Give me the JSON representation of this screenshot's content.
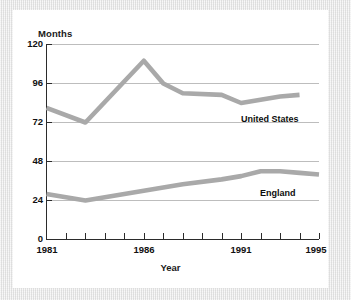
{
  "chart_data": {
    "type": "line",
    "title": "",
    "xlabel": "Year",
    "ylabel": "Months",
    "xlim": [
      1981,
      1995
    ],
    "ylim": [
      0,
      120
    ],
    "grid": true,
    "legend_position": "inline-right",
    "x": [
      1981,
      1982,
      1983,
      1984,
      1985,
      1986,
      1987,
      1988,
      1989,
      1990,
      1991,
      1992,
      1993,
      1994,
      1995
    ],
    "y_ticks": [
      0,
      24,
      48,
      72,
      96,
      120
    ],
    "y_tick_labels": [
      "0",
      "24",
      "48",
      "72",
      "96",
      "120"
    ],
    "x_ticks": [
      1981,
      1982,
      1983,
      1984,
      1985,
      1986,
      1987,
      1988,
      1989,
      1990,
      1991,
      1992,
      1993,
      1994,
      1995
    ],
    "x_tick_labels_shown": [
      "1981",
      "1986",
      "1991",
      "1995"
    ],
    "x_tick_labels_shown_values": [
      1981,
      1986,
      1991,
      1995
    ],
    "series": [
      {
        "name": "United States",
        "color": "#a9a9a9",
        "x": [
          1981,
          1983,
          1986,
          1987,
          1988,
          1990,
          1991,
          1992,
          1993,
          1994
        ],
        "values": [
          81,
          72,
          110,
          96,
          90,
          89,
          84,
          86,
          88,
          89
        ]
      },
      {
        "name": "England",
        "color": "#a9a9a9",
        "x": [
          1981,
          1983,
          1986,
          1988,
          1990,
          1991,
          1992,
          1993,
          1994,
          1995
        ],
        "values": [
          28,
          24,
          30,
          34,
          37,
          39,
          42,
          42,
          41,
          40
        ]
      }
    ],
    "annotations": [
      {
        "text": "United States",
        "x": 1991.3,
        "y": 78
      },
      {
        "text": "England",
        "x": 1992.3,
        "y": 33
      }
    ],
    "colors": {
      "line": "#a9a9a9",
      "axis": "#2b2b2b",
      "grid": "#bdbdbd",
      "text": "#111111",
      "card_background": "#ffffff",
      "page_background": "#e8e8e8"
    }
  },
  "labels": {
    "y_axis_title": "Months",
    "x_axis_title": "Year",
    "series_us": "United States",
    "series_england": "England",
    "y0": "0",
    "y24": "24",
    "y48": "48",
    "y72": "72",
    "y96": "96",
    "y120": "120",
    "x1981": "1981",
    "x1986": "1986",
    "x1991": "1991",
    "x1995": "1995"
  }
}
